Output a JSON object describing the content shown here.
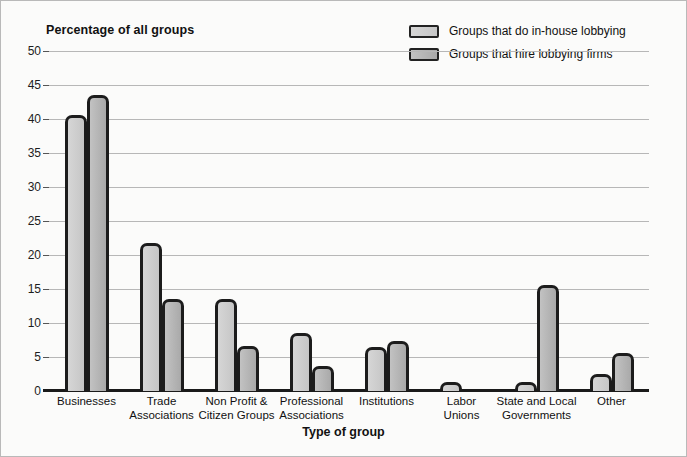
{
  "chart_data": {
    "type": "bar",
    "title": "Percentage of all groups",
    "xlabel": "Type of group",
    "ylabel": "Percentage of all groups",
    "ylim": [
      0,
      50
    ],
    "ytick_step": 5,
    "yticks": [
      "0",
      "5",
      "10",
      "15",
      "20",
      "25",
      "30",
      "35",
      "40",
      "45",
      "50"
    ],
    "grid": true,
    "legend_position": "top-right",
    "categories": [
      "Businesses",
      "Trade Associations",
      "Non Profit & Citizen Groups",
      "Professional Associations",
      "Institutions",
      "Labor Unions",
      "State and Local Governments",
      "Other"
    ],
    "category_lines": [
      [
        "Businesses"
      ],
      [
        "Trade",
        "Associations"
      ],
      [
        "Non Profit &",
        "Citizen Groups"
      ],
      [
        "Professional",
        "Associations"
      ],
      [
        "Institutions"
      ],
      [
        "Labor",
        "Unions"
      ],
      [
        "State and Local",
        "Governments"
      ],
      [
        "Other"
      ]
    ],
    "series": [
      {
        "name": "Groups that do in-house lobbying",
        "color": "#d0d0d0",
        "values": [
          40.6,
          21.7,
          13.6,
          8.5,
          6.4,
          1.3,
          1.3,
          2.5
        ]
      },
      {
        "name": "Groups that hire lobbying firms",
        "color": "#b5b5b5",
        "values": [
          43.5,
          13.6,
          6.6,
          3.7,
          7.3,
          0,
          15.6,
          5.6
        ]
      }
    ]
  },
  "legend": {
    "items": [
      "Groups that do in-house lobbying",
      "Groups that hire lobbying firms"
    ]
  },
  "colors": {
    "axis": "#1a1a1a",
    "grid": "#b7b7b7",
    "bar_outline": "#1c1c1c",
    "series_1": "#d0d0d0",
    "series_2": "#b5b5b5",
    "background": "#fbfbfa",
    "frame": "#b9b9b9"
  }
}
